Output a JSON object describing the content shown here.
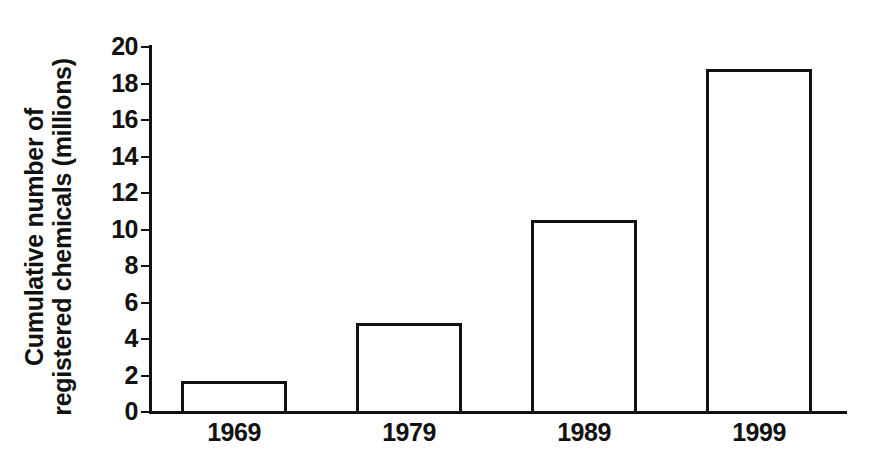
{
  "chart_data": {
    "type": "bar",
    "title": "",
    "subtitle": "",
    "xlabel": "",
    "ylabel": "Cumulative number of registered chemicals (millions)",
    "ylabel_lines": [
      "Cumulative number of",
      "registered chemicals (millions)"
    ],
    "categories": [
      "1969",
      "1979",
      "1989",
      "1999"
    ],
    "values": [
      1.7,
      4.9,
      10.5,
      18.8
    ],
    "ylim": [
      0,
      20
    ],
    "ytick_values": [
      0,
      2,
      4,
      6,
      8,
      10,
      12,
      14,
      16,
      18,
      20
    ],
    "ytick_labels": [
      "0",
      "2",
      "4",
      "6",
      "8",
      "10",
      "12",
      "14",
      "16",
      "18",
      "20"
    ],
    "grid": false,
    "legend": false,
    "legend_position": "none",
    "bar_fill_color": "#ffffff",
    "bar_edge_color": "#111111",
    "axis_color": "#111111",
    "background_color": "#ffffff"
  }
}
